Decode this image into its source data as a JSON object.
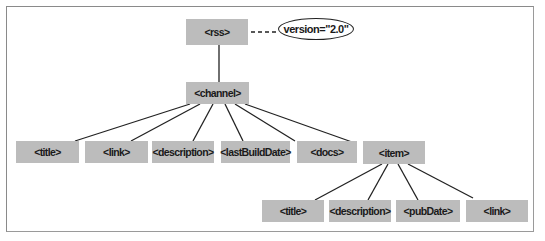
{
  "diagram": {
    "root": {
      "label": "<rss>",
      "attribute": "version=\"2.0\""
    },
    "channel": {
      "label": "<channel>"
    },
    "channel_children": [
      {
        "label": "<title>"
      },
      {
        "label": "<link>"
      },
      {
        "label": "<description>"
      },
      {
        "label": "<lastBuildDate>"
      },
      {
        "label": "<docs>"
      },
      {
        "label": "<item>"
      }
    ],
    "item_children": [
      {
        "label": "<title>"
      },
      {
        "label": "<description>"
      },
      {
        "label": "<pubDate>"
      },
      {
        "label": "<link>"
      }
    ]
  },
  "colors": {
    "node_fill": "#bcbcbc",
    "line": "#222222",
    "frame": "#8a8a8a"
  }
}
